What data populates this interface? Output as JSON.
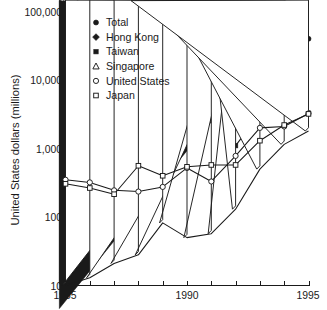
{
  "chart_data": {
    "type": "line",
    "title": "",
    "xlabel": "",
    "ylabel": "United States dollars (millions)",
    "yscale": "log",
    "ylim": [
      10,
      100000
    ],
    "xlim": [
      1985,
      1995
    ],
    "grid": false,
    "legend_position": "upper left inside",
    "ytick_labels": [
      "10",
      "100",
      "1,000",
      "10,000",
      "100,000"
    ],
    "ytick_values": [
      10,
      100,
      1000,
      10000,
      100000
    ],
    "xtick_labels": [
      "1985",
      "1990",
      "1995"
    ],
    "xtick_values": [
      1985,
      1990,
      1995
    ],
    "x": [
      1985,
      1986,
      1987,
      1988,
      1989,
      1990,
      1991,
      1992,
      1993,
      1994,
      1995
    ],
    "series": [
      {
        "name": "Total",
        "marker": "filled-circle",
        "x": [
          1985,
          1986,
          1987,
          1988,
          1989,
          1990,
          1991,
          1992,
          1993,
          1994,
          1995
        ],
        "values": [
          1950,
          2250,
          2300,
          3300,
          3400,
          3500,
          4400,
          8000,
          26000,
          34000,
          40000
        ]
      },
      {
        "name": "Hong Kong",
        "marker": "filled-diamond",
        "x": [
          1985,
          1986,
          1987,
          1988,
          1989,
          1990,
          1991,
          1992,
          1993,
          1994,
          1995
        ],
        "values": [
          1000,
          1300,
          1600,
          2050,
          2050,
          1900,
          2400,
          11000,
          17500,
          20000,
          20000
        ]
      },
      {
        "name": "Taiwan",
        "marker": "filled-square",
        "x": [
          1992,
          1993,
          1994,
          1995
        ],
        "values": [
          1100,
          3200,
          3400,
          3300
        ]
      },
      {
        "name": "Singapore",
        "marker": "open-triangle",
        "x": [
          1985,
          1986,
          1987,
          1988,
          1989,
          1990,
          1991,
          1992,
          1993,
          1994,
          1995
        ],
        "values": [
          10,
          13,
          21,
          28,
          82,
          50,
          57,
          130,
          500,
          1150,
          1800
        ]
      },
      {
        "name": "United States",
        "marker": "open-circle",
        "x": [
          1985,
          1986,
          1987,
          1988,
          1989,
          1990,
          1991,
          1992,
          1993,
          1994,
          1995
        ],
        "values": [
          350,
          320,
          245,
          235,
          275,
          520,
          330,
          780,
          2000,
          2100,
          3250
        ]
      },
      {
        "name": "Japan",
        "marker": "open-square",
        "x": [
          1985,
          1986,
          1987,
          1988,
          1989,
          1990,
          1991,
          1992,
          1993,
          1994,
          1995
        ],
        "values": [
          305,
          265,
          215,
          560,
          400,
          540,
          575,
          575,
          1300,
          2200,
          3200
        ]
      }
    ]
  },
  "legend": {
    "entries": [
      {
        "label": "Total",
        "marker": "filled-circle"
      },
      {
        "label": "Hong Kong",
        "marker": "filled-diamond"
      },
      {
        "label": "Taiwan",
        "marker": "filled-square"
      },
      {
        "label": "Singapore",
        "marker": "open-triangle"
      },
      {
        "label": "United States",
        "marker": "open-circle"
      },
      {
        "label": "Japan",
        "marker": "open-square"
      }
    ]
  },
  "axes": {
    "y_axis_title": "United States dollars (millions)",
    "y_labels": [
      "100,000",
      "10,000",
      "1,000",
      "100",
      "10"
    ],
    "x_labels": [
      "1985",
      "1990",
      "1995"
    ]
  },
  "colors": {
    "ink": "#1a1a1a",
    "background": "#ffffff"
  }
}
